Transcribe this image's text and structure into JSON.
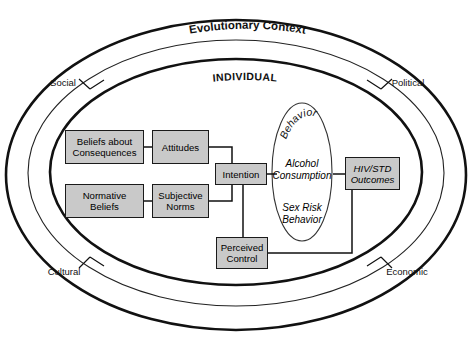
{
  "figure": {
    "type": "conceptual-model-diagram",
    "title_label": "Evolutionary Context",
    "individual_label": "INDIVIDUAL"
  },
  "context_labels": {
    "top": "Evolutionary Context",
    "inner_ring": "INDIVIDUAL",
    "social": "Social",
    "political": "Political",
    "cultural": "Cultural",
    "economic": "Economic"
  },
  "nodes": [
    {
      "id": "beliefs-about-consequences",
      "label": "Beliefs about\nConsequences",
      "line1": "Beliefs about",
      "line2": "Consequences",
      "style": "filled"
    },
    {
      "id": "attitudes",
      "label": "Attitudes",
      "line1": "Attitudes",
      "line2": "",
      "style": "filled"
    },
    {
      "id": "normative-beliefs",
      "label": "Normative\nBeliefs",
      "line1": "Normative",
      "line2": "Beliefs",
      "style": "filled"
    },
    {
      "id": "subjective-norms",
      "label": "Subjective\nNorms",
      "line1": "Subjective",
      "line2": "Norms",
      "style": "filled"
    },
    {
      "id": "intention",
      "label": "Intention",
      "line1": "Intention",
      "line2": "",
      "style": "filled"
    },
    {
      "id": "perceived-control",
      "label": "Perceived\nControl",
      "line1": "Perceived",
      "line2": "Control",
      "style": "filled"
    },
    {
      "id": "hiv-std-outcomes",
      "label": "HIV/STD\nOutcomes",
      "line1": "HIV/STD",
      "line2": "Outcomes",
      "style": "filled-italic"
    }
  ],
  "behavior_ellipse": {
    "heading": "Behavior",
    "items": [
      {
        "line1": "Alcohol",
        "line2": "Consumption"
      },
      {
        "line1": "Sex Risk",
        "line2": "Behavior"
      }
    ]
  },
  "colors": {
    "node_fill": "#c9c9c9",
    "node_border": "#1a1a1a",
    "line": "#111111",
    "background": "#ffffff"
  }
}
